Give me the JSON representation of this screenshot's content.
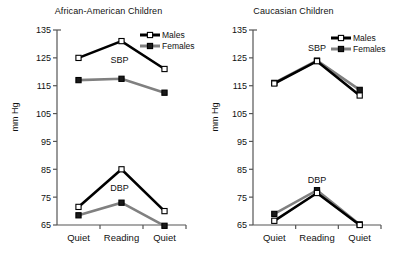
{
  "figure": {
    "y_axis_label": "mm Hg",
    "categories": [
      "Quiet",
      "Reading",
      "Quiet"
    ],
    "y_ticks": [
      65,
      75,
      85,
      95,
      105,
      115,
      125,
      135
    ],
    "ylim": [
      65,
      135
    ],
    "legend": {
      "males_label": "Males",
      "females_label": "Females"
    },
    "annotations": {
      "sbp": "SBP",
      "dbp": "DBP"
    },
    "colors": {
      "males_line": "#000000",
      "males_marker_fill": "#ffffff",
      "females_line": "#808080",
      "females_marker_fill": "#1a1a1a",
      "axis": "#555555",
      "text": "#111111"
    }
  },
  "chart_data": [
    {
      "type": "line",
      "title": "African-American Children",
      "xlabel": "",
      "ylabel": "mm Hg",
      "ylim": [
        65,
        135
      ],
      "yticks": [
        65,
        75,
        85,
        95,
        105,
        115,
        125,
        135
      ],
      "grid": false,
      "legend_position": "top-right",
      "categories": [
        "Quiet",
        "Reading",
        "Quiet"
      ],
      "groups": [
        {
          "name": "SBP",
          "series": [
            {
              "name": "Males",
              "values": [
                125.0,
                131.0,
                121.0
              ]
            },
            {
              "name": "Females",
              "values": [
                117.0,
                117.5,
                112.5
              ]
            }
          ]
        },
        {
          "name": "DBP",
          "series": [
            {
              "name": "Males",
              "values": [
                71.5,
                85.0,
                70.0
              ]
            },
            {
              "name": "Females",
              "values": [
                68.5,
                73.0,
                64.7
              ]
            }
          ]
        }
      ]
    },
    {
      "type": "line",
      "title": "Caucasian Children",
      "xlabel": "",
      "ylabel": "mm Hg",
      "ylim": [
        65,
        135
      ],
      "yticks": [
        65,
        75,
        85,
        95,
        105,
        115,
        125,
        135
      ],
      "grid": false,
      "legend_position": "top-right",
      "categories": [
        "Quiet",
        "Reading",
        "Quiet"
      ],
      "groups": [
        {
          "name": "SBP",
          "series": [
            {
              "name": "Males",
              "values": [
                115.8,
                123.8,
                111.5
              ]
            },
            {
              "name": "Females",
              "values": [
                116.0,
                124.0,
                113.5
              ]
            }
          ]
        },
        {
          "name": "DBP",
          "series": [
            {
              "name": "Males",
              "values": [
                66.5,
                76.5,
                65.0
              ]
            },
            {
              "name": "Females",
              "values": [
                69.0,
                77.5,
                65.2
              ]
            }
          ]
        }
      ]
    }
  ]
}
